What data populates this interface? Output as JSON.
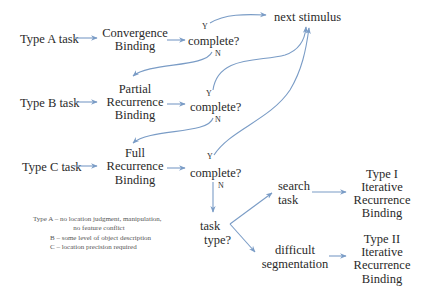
{
  "diagram": {
    "colors": {
      "arrow": "#7a9cc6",
      "text": "#2a2a2a",
      "legend_text": "#555555"
    },
    "tasks": [
      {
        "id": "A",
        "label": "Type A task"
      },
      {
        "id": "B",
        "label": "Type B task"
      },
      {
        "id": "C",
        "label": "Type C task"
      }
    ],
    "binding_nodes": {
      "A": [
        "Convergence",
        "Binding"
      ],
      "B": [
        "Partial",
        "Recurrence",
        "Binding"
      ],
      "C": [
        "Full",
        "Recurrence",
        "Binding"
      ]
    },
    "decision": {
      "label": "complete?",
      "yes": "Y",
      "no": "N"
    },
    "next_stimulus": "next stimulus",
    "task_type": [
      "task",
      "type?"
    ],
    "branches": {
      "search": [
        "search",
        "task"
      ],
      "difficult": [
        "difficult",
        "segmentation"
      ]
    },
    "outcomes": {
      "type1": [
        "Type I",
        "Iterative",
        "Recurrence",
        "Binding"
      ],
      "type2": [
        "Type II",
        "Iterative",
        "Recurrence",
        "Binding"
      ]
    },
    "legend": [
      "Type  A – no location judgment, manipulation,",
      "no feature conflict",
      "B – some level of object description",
      "C – location precision required"
    ]
  }
}
